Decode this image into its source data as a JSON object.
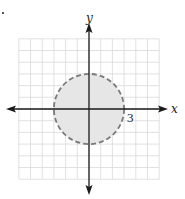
{
  "figure": {
    "type": "graph-of-inequality",
    "axes": {
      "x_label": "x",
      "y_label": "y",
      "x_range": [
        -6,
        6
      ],
      "y_range": [
        -6,
        6
      ],
      "grid_unit": 1
    },
    "region": {
      "shape": "circle",
      "center": [
        0,
        0
      ],
      "radius": 3,
      "boundary_style": "dashed",
      "shaded": "inside",
      "fill_color": "#e6e6e6",
      "boundary_color": "#7a7a7a"
    },
    "tick_labels": [
      {
        "axis": "x",
        "value": 3,
        "text": "3"
      }
    ],
    "colors": {
      "grid": "#d9d9d9",
      "axis": "#1a1a1a",
      "background": "#ffffff"
    }
  }
}
